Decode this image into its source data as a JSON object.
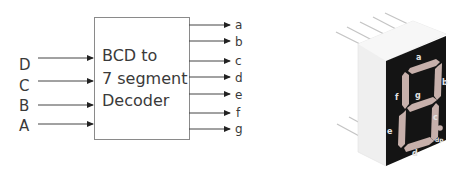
{
  "decoder": {
    "title_lines": [
      "BCD  to",
      "7 segment",
      "Decoder"
    ],
    "inputs": [
      {
        "label": "D",
        "y": 58
      },
      {
        "label": "C",
        "y": 81
      },
      {
        "label": "B",
        "y": 105
      },
      {
        "label": "A",
        "y": 124
      }
    ],
    "outputs": [
      {
        "label": "a",
        "y": 25
      },
      {
        "label": "b",
        "y": 41
      },
      {
        "label": "c",
        "y": 61
      },
      {
        "label": "d",
        "y": 77
      },
      {
        "label": "e",
        "y": 94
      },
      {
        "label": "f",
        "y": 113
      },
      {
        "label": "g",
        "y": 129
      }
    ]
  },
  "display": {
    "segment_labels": {
      "a": "a",
      "b": "b",
      "c": "c",
      "d": "d",
      "e": "e",
      "f": "f",
      "g": "g",
      "dp": "dp"
    },
    "colors": {
      "body": "#f2f2f2",
      "face": "#1a1a1a",
      "segment": "#c9b2ad",
      "label": "#e6e6e6",
      "pin": "#c8c8c8"
    }
  }
}
